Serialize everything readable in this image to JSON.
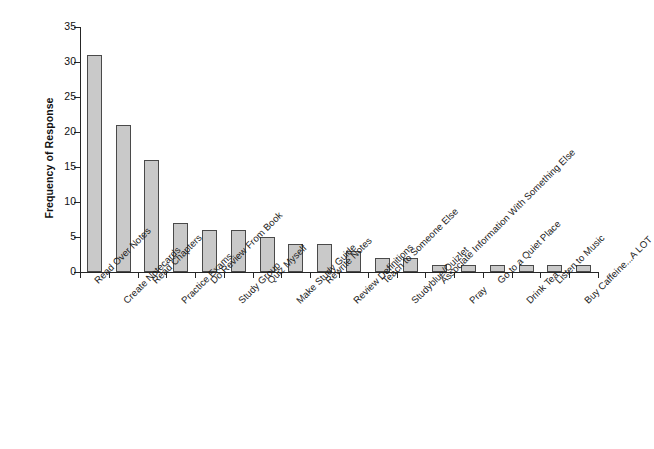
{
  "chart_data": {
    "type": "bar",
    "title": "",
    "xlabel": "",
    "ylabel": "Frequency of Response",
    "ylim": [
      0,
      35
    ],
    "yticks": [
      0,
      5,
      10,
      15,
      20,
      25,
      30,
      35
    ],
    "ytick_labels": [
      "0",
      "5",
      "10",
      "15",
      "20",
      "25",
      "30",
      "35"
    ],
    "grid": false,
    "legend": "none",
    "bar_fill_color": "#c9c9c9",
    "bar_edge_color": "#4a4a4a",
    "axis_color": "#262626",
    "background_color": "#ffffff",
    "categories": [
      "Read Over Notes",
      "Create Notecards",
      "Read Chapters",
      "Practice Exams",
      "Do Review From Book",
      "Study Group",
      "Quiz Myself",
      "Make Study Guide",
      "Rewrite Notes",
      "Review Definitions",
      "Teach to Someone Else",
      "Studyblue/Quizlet",
      "Associate Information With Something Else",
      "Pray",
      "Go to a Quiet Place",
      "Drink Tea",
      "Listen to Music",
      "Buy Caffeine...A LOT"
    ],
    "values": [
      31,
      21,
      16,
      7,
      6,
      6,
      5,
      4,
      4,
      3,
      2,
      2,
      1,
      1,
      1,
      1,
      1,
      1
    ]
  },
  "axis": {
    "y_title": "Frequency of Response"
  }
}
